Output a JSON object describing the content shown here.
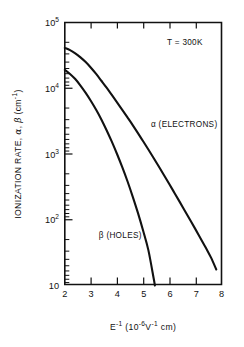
{
  "chart_data": {
    "type": "line",
    "title": "",
    "xlabel": "E⁻¹ (10⁻⁶V⁻¹ cm)",
    "ylabel": "IONIZATION RATE, α, β (cm⁻¹)",
    "yscale": "log",
    "xscale": "linear",
    "xlim": [
      2,
      8
    ],
    "ylim": [
      10,
      100000
    ],
    "grid": false,
    "legend_position": "inline-annotation",
    "annotations": [
      {
        "text": "T = 300K",
        "x": 6.6,
        "y": 45000
      }
    ],
    "xticks": [
      2,
      3,
      4,
      5,
      6,
      7,
      8
    ],
    "xtick_labels": [
      "2",
      "3",
      "4",
      "5",
      "6",
      "7",
      "8"
    ],
    "yticks": [
      10,
      100,
      1000,
      10000,
      100000
    ],
    "ytick_labels": [
      "10",
      "10",
      "10",
      "10",
      "10"
    ],
    "ytick_exponents": [
      "",
      "2",
      "3",
      "4",
      "5"
    ],
    "series": [
      {
        "name": "alpha",
        "label": "α (ELECTRONS)",
        "label_x": 5.3,
        "label_y": 2600,
        "x": [
          2.0,
          2.2,
          2.4,
          2.6,
          2.8,
          3.0,
          3.2,
          3.4,
          3.6,
          3.8,
          4.0,
          4.2,
          4.4,
          4.6,
          4.8,
          5.0,
          5.2,
          5.4,
          5.6,
          5.8,
          6.0,
          6.2,
          6.4,
          6.6,
          6.8,
          7.0,
          7.2,
          7.4,
          7.6,
          7.8
        ],
        "y": [
          41000,
          38000,
          34000,
          29500,
          25000,
          20500,
          16500,
          13000,
          10200,
          7900,
          6100,
          4700,
          3600,
          2750,
          2080,
          1560,
          1170,
          870,
          645,
          476,
          350,
          256,
          187,
          136,
          99,
          72,
          52,
          37.5,
          26.5,
          17.5
        ]
      },
      {
        "name": "beta",
        "label": "β (HOLES)",
        "label_x": 3.3,
        "label_y": 52,
        "x": [
          2.0,
          2.2,
          2.4,
          2.6,
          2.8,
          3.0,
          3.2,
          3.4,
          3.6,
          3.8,
          4.0,
          4.2,
          4.4,
          4.6,
          4.8,
          5.0,
          5.2,
          5.4,
          5.45
        ],
        "y": [
          19000,
          16500,
          13800,
          11000,
          8500,
          6400,
          4700,
          3350,
          2300,
          1540,
          1000,
          630,
          385,
          225,
          127,
          68,
          34.5,
          13.0,
          10.0
        ]
      }
    ]
  },
  "axis": {
    "x_title_main": "E",
    "x_title_sup1": "-1",
    "x_title_mid": " (10",
    "x_title_sup2": "-6",
    "x_title_v": "V",
    "x_title_sup3": "-1",
    "x_title_end": " cm)",
    "y_title_main": "IONIZATION RATE, ",
    "y_title_alpha": "α",
    "y_title_comma": ", ",
    "y_title_beta": "β",
    "y_title_units": " (cm",
    "y_title_units_sup": "-1",
    "y_title_close": ")"
  }
}
